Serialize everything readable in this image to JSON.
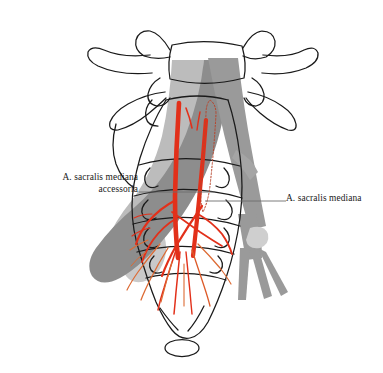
{
  "figure": {
    "kind": "anatomical-line-drawing",
    "background": "#ffffff"
  },
  "labels": {
    "left": {
      "text": "A. sacralis mediana\naccessoria",
      "align": "right"
    },
    "right": {
      "text": "A. sacralis mediana",
      "align": "left"
    }
  },
  "colors": {
    "artery_red": "#e2301a",
    "artery_orange": "#dd6a33",
    "vessel_gray_dark": "#8d8d8d",
    "vessel_gray_mid": "#9e9e9e",
    "vessel_gray_light": "#bdbdbd",
    "bone_outline": "#1a1a1a",
    "leader_line": "#6e6e6e",
    "background": "#ffffff"
  },
  "structures": [
    {
      "name": "l5-vertebral-body",
      "type": "bone-outline"
    },
    {
      "name": "left-transverse-process",
      "type": "bone-outline"
    },
    {
      "name": "right-transverse-process",
      "type": "bone-outline"
    },
    {
      "name": "sacrum",
      "type": "bone-outline"
    },
    {
      "name": "coccyx",
      "type": "bone-outline"
    },
    {
      "name": "sacral-transverse-ridges",
      "type": "bone-detail"
    },
    {
      "name": "anterior-sacral-foramina",
      "type": "bone-detail"
    },
    {
      "name": "left-common-iliac-vessel",
      "type": "vessel-gray"
    },
    {
      "name": "right-common-iliac-vessel",
      "type": "vessel-gray"
    },
    {
      "name": "median-sacral-artery",
      "type": "artery-red"
    },
    {
      "name": "accessory-median-sacral-artery",
      "type": "artery-red"
    },
    {
      "name": "hidden-artery-segment",
      "type": "artery-dashed"
    },
    {
      "name": "sacral-arterial-branches",
      "type": "artery-red"
    }
  ]
}
